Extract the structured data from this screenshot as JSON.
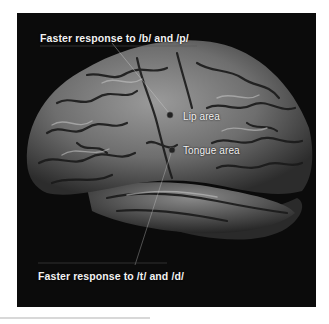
{
  "figure": {
    "background_color": "#0b0b0b",
    "label_color": "#f2f2f2",
    "labels": {
      "top": "Faster response to /b/ and /p/",
      "lip": "Lip area",
      "tongue": "Tongue area",
      "bottom": "Faster response to /t/ and /d/"
    },
    "markers": [
      {
        "name": "lip-marker",
        "label": "Lip area"
      },
      {
        "name": "tongue-marker",
        "label": "Tongue area"
      }
    ]
  }
}
